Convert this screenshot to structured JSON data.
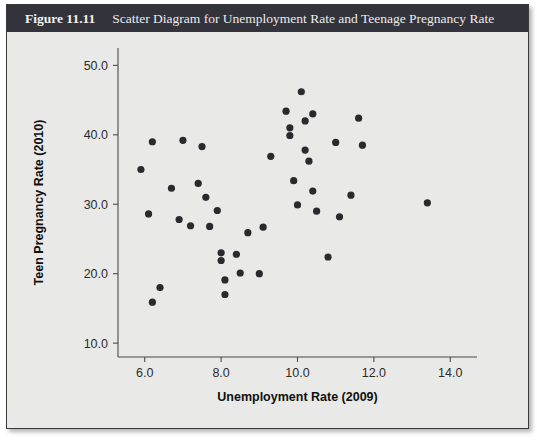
{
  "figure": {
    "number": "Figure 11.11",
    "caption": "Scatter Diagram for Unemployment Rate and Teenage Pregnancy Rate",
    "title_bar_color": "#33333c",
    "panel_color": "#e9e9e7",
    "point_color": "#2a2a2e"
  },
  "chart_data": {
    "type": "scatter",
    "title": "Scatter Diagram for Unemployment Rate and Teenage Pregnancy Rate",
    "xlabel": "Unemployment Rate (2009)",
    "ylabel": "Teen Pregnancy Rate (2010)",
    "xlim": [
      5.3,
      14.7
    ],
    "ylim": [
      8.0,
      52.5
    ],
    "xticks": [
      6.0,
      8.0,
      10.0,
      12.0,
      14.0
    ],
    "xtick_labels": [
      "6.0",
      "8.0",
      "10.0",
      "12.0",
      "14.0"
    ],
    "yticks": [
      10.0,
      20.0,
      30.0,
      40.0,
      50.0
    ],
    "ytick_labels": [
      "10.0",
      "20.0",
      "30.0",
      "40.0",
      "50.0"
    ],
    "grid": false,
    "legend": false,
    "marker": "circle",
    "points": [
      {
        "x": 5.9,
        "y": 35.0
      },
      {
        "x": 6.2,
        "y": 39.0
      },
      {
        "x": 6.1,
        "y": 28.6
      },
      {
        "x": 6.2,
        "y": 15.9
      },
      {
        "x": 6.4,
        "y": 18.0
      },
      {
        "x": 6.7,
        "y": 32.3
      },
      {
        "x": 6.9,
        "y": 27.8
      },
      {
        "x": 7.0,
        "y": 39.2
      },
      {
        "x": 7.2,
        "y": 26.9
      },
      {
        "x": 7.4,
        "y": 33.0
      },
      {
        "x": 7.5,
        "y": 38.3
      },
      {
        "x": 7.6,
        "y": 31.0
      },
      {
        "x": 7.7,
        "y": 26.8
      },
      {
        "x": 7.9,
        "y": 29.1
      },
      {
        "x": 8.0,
        "y": 23.0
      },
      {
        "x": 8.0,
        "y": 21.9
      },
      {
        "x": 8.1,
        "y": 19.1
      },
      {
        "x": 8.1,
        "y": 17.0
      },
      {
        "x": 8.4,
        "y": 22.8
      },
      {
        "x": 8.5,
        "y": 20.1
      },
      {
        "x": 8.7,
        "y": 25.9
      },
      {
        "x": 9.0,
        "y": 20.0
      },
      {
        "x": 9.1,
        "y": 26.7
      },
      {
        "x": 9.3,
        "y": 36.9
      },
      {
        "x": 9.7,
        "y": 43.4
      },
      {
        "x": 9.8,
        "y": 41.0
      },
      {
        "x": 9.8,
        "y": 39.9
      },
      {
        "x": 9.9,
        "y": 33.4
      },
      {
        "x": 10.0,
        "y": 29.9
      },
      {
        "x": 10.1,
        "y": 46.2
      },
      {
        "x": 10.2,
        "y": 42.0
      },
      {
        "x": 10.2,
        "y": 37.8
      },
      {
        "x": 10.3,
        "y": 36.2
      },
      {
        "x": 10.4,
        "y": 43.0
      },
      {
        "x": 10.4,
        "y": 31.9
      },
      {
        "x": 10.5,
        "y": 29.0
      },
      {
        "x": 10.8,
        "y": 22.4
      },
      {
        "x": 11.0,
        "y": 38.9
      },
      {
        "x": 11.1,
        "y": 28.2
      },
      {
        "x": 11.4,
        "y": 31.3
      },
      {
        "x": 11.6,
        "y": 42.4
      },
      {
        "x": 11.7,
        "y": 38.5
      },
      {
        "x": 13.4,
        "y": 30.2
      }
    ]
  }
}
